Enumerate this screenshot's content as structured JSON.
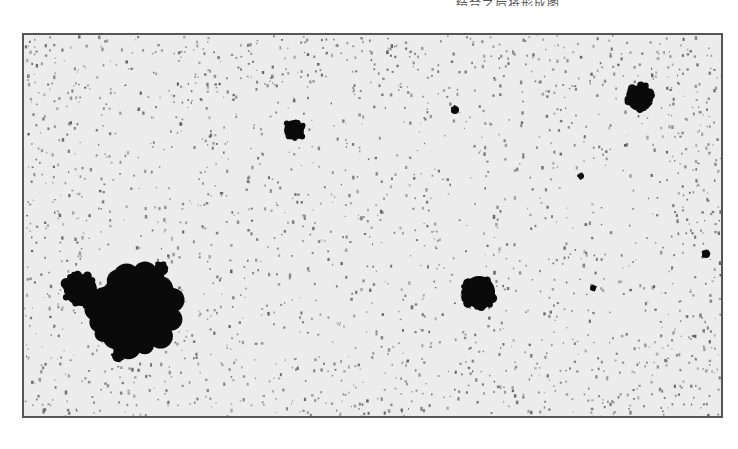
{
  "caption": {
    "partial_text": "……………………………………………………………………………………结合之后将形成图"
  },
  "micrograph": {
    "background_color": "#ececec",
    "particle_color": "#0a0a0a",
    "noise_color": "#555555",
    "frame_color": "#555555",
    "clusters": [
      {
        "id": "large-cluster",
        "cx": 110,
        "cy": 275,
        "r": 38
      },
      {
        "id": "large-cluster-left-lobe",
        "cx": 57,
        "cy": 255,
        "r": 16
      },
      {
        "id": "large-cluster-top-lobe",
        "cx": 137,
        "cy": 234,
        "r": 7
      },
      {
        "id": "large-cluster-bottom-lobe",
        "cx": 94,
        "cy": 321,
        "r": 6
      },
      {
        "id": "small-cluster-top-left",
        "cx": 270,
        "cy": 95,
        "r": 10
      },
      {
        "id": "tiny-dot-top-center",
        "cx": 431,
        "cy": 75,
        "r": 4
      },
      {
        "id": "cluster-top-right",
        "cx": 616,
        "cy": 63,
        "r": 13
      },
      {
        "id": "cluster-center-right",
        "cx": 455,
        "cy": 257,
        "r": 16
      },
      {
        "id": "tiny-dot-right",
        "cx": 682,
        "cy": 219,
        "r": 4
      },
      {
        "id": "tiny-dot-center",
        "cx": 569,
        "cy": 253,
        "r": 3
      },
      {
        "id": "tiny-dot-upper-right",
        "cx": 557,
        "cy": 141,
        "r": 3
      }
    ]
  }
}
